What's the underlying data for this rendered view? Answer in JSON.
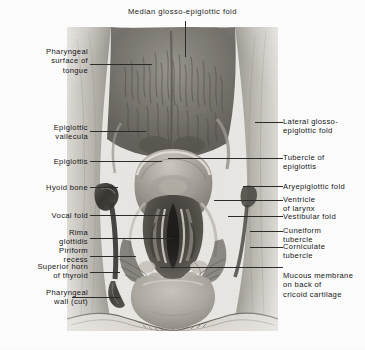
{
  "figure": {
    "title": "Median glosso-epiglottic fold",
    "media": "monochrome-anatomical-photograph"
  },
  "colors": {
    "background": "#fdfdfd",
    "text": "#151515",
    "leader_line": "#2b2b2b",
    "photo_light": "#e8e7e3",
    "photo_mid": "#a9a6a0",
    "photo_dark": "#4a4641",
    "photo_darkest": "#16140f"
  },
  "labels_left": [
    {
      "text": "Pharyngeal\nsurface of\ntongue",
      "lines": 3,
      "leader_y": 64
    },
    {
      "text": "Epiglottic\nvallecula",
      "lines": 2,
      "leader_y": 131
    },
    {
      "text": "Epiglottis",
      "lines": 1,
      "leader_y": 161
    },
    {
      "text": "Hyoid bone",
      "lines": 1,
      "leader_y": 187
    },
    {
      "text": "Vocal fold",
      "lines": 1,
      "leader_y": 215
    },
    {
      "text": "Rima\nglottidis",
      "lines": 2,
      "leader_y": 238
    },
    {
      "text": "Piriform\nrecess",
      "lines": 2,
      "leader_y": 256
    },
    {
      "text": "Superior horn\nof thyroid",
      "lines": 2,
      "leader_y": 272
    },
    {
      "text": "Pharyngeal\nwall (cut)",
      "lines": 2,
      "leader_y": 297
    }
  ],
  "labels_right": [
    {
      "text": "Lateral glosso-\nepiglottic fold",
      "lines": 2,
      "leader_y": 122
    },
    {
      "text": "Tubercle of\nepiglottis",
      "lines": 2,
      "leader_y": 158
    },
    {
      "text": "Aryepiglottic fold",
      "lines": 1,
      "leader_y": 186
    },
    {
      "text": "Ventricle\nof larynx",
      "lines": 2,
      "leader_y": 200
    },
    {
      "text": "Vestibular fold",
      "lines": 1,
      "leader_y": 216
    },
    {
      "text": "Cuneiform\ntubercle",
      "lines": 2,
      "leader_y": 231
    },
    {
      "text": "Corniculate\ntubercle",
      "lines": 2,
      "leader_y": 247
    },
    {
      "text": "Mucous membrane\non back of\ncricoid cartilage",
      "lines": 3,
      "leader_y": 267
    }
  ]
}
